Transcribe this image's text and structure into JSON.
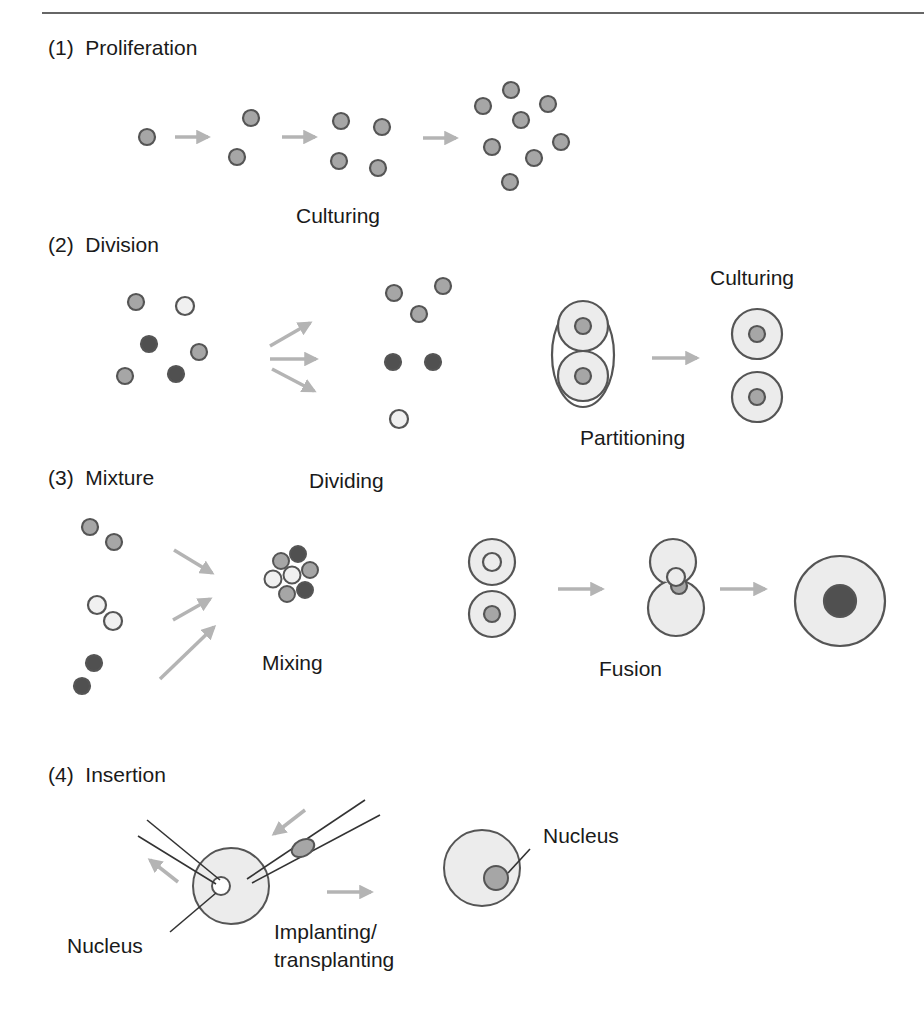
{
  "sections": [
    {
      "number": "(1)",
      "title": "Proliferation",
      "step_labels": [
        "Culturing"
      ]
    },
    {
      "number": "(2)",
      "title": "Division",
      "step_labels": [
        "Dividing",
        "Partitioning",
        "Culturing"
      ]
    },
    {
      "number": "(3)",
      "title": "Mixture",
      "step_labels": [
        "Mixing",
        "Fusion"
      ]
    },
    {
      "number": "(4)",
      "title": "Insertion",
      "step_labels": [
        "Nucleus",
        "Implanting/",
        "transplanting",
        "Nucleus"
      ]
    }
  ],
  "colors": {
    "cell_medium": "#a6a6a6",
    "cell_dark": "#505050",
    "cell_light": "#f0f0f0",
    "cytoplasm": "#ececec",
    "outline": "#555555",
    "arrow": "#b4b4b4",
    "rule": "#666666"
  }
}
